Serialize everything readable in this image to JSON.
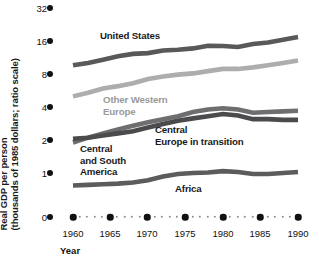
{
  "chart_data": {
    "type": "line",
    "title": "",
    "subtitle": "",
    "xlabel": "Year",
    "ylabel_line1": "Real GDP per person",
    "ylabel_line2": "(thousands of 1985 dollars; ratio scale)",
    "ylabel": "Real GDP per person (thousands of 1985 dollars; ratio scale)",
    "scale": "log2",
    "grid": false,
    "legend_position": "inline-annotations",
    "ylim": [
      1,
      32
    ],
    "ytick_labels": [
      "32",
      "16",
      "8",
      "4",
      "2",
      "1",
      "0"
    ],
    "ytick_values": [
      32,
      16,
      8,
      4,
      2,
      1,
      0
    ],
    "xlim": [
      1960,
      1990
    ],
    "xtick_labels": [
      "1960",
      "1965",
      "1970",
      "1975",
      "1980",
      "1985",
      "1990"
    ],
    "xtick_values": [
      1960,
      1965,
      1970,
      1975,
      1980,
      1985,
      1990
    ],
    "x": [
      1960,
      1962,
      1964,
      1966,
      1968,
      1970,
      1972,
      1974,
      1976,
      1978,
      1980,
      1982,
      1984,
      1986,
      1988,
      1990
    ],
    "series": [
      {
        "name": "United States",
        "color": "#59595b",
        "values": [
          9.6,
          10.1,
          10.8,
          11.6,
          12.2,
          12.4,
          13.1,
          13.3,
          13.7,
          14.5,
          14.4,
          14.1,
          15.0,
          15.5,
          16.4,
          17.4
        ]
      },
      {
        "name": "Other Western Europe",
        "color": "#adadad",
        "values": [
          5.0,
          5.4,
          5.9,
          6.2,
          6.6,
          7.2,
          7.6,
          7.9,
          8.1,
          8.5,
          8.9,
          8.9,
          9.2,
          9.6,
          10.1,
          10.6
        ]
      },
      {
        "name": "Central Europe in transition",
        "color": "#6e6e70",
        "values": [
          1.9,
          2.1,
          2.3,
          2.5,
          2.7,
          2.9,
          3.1,
          3.3,
          3.6,
          3.8,
          3.9,
          3.8,
          3.55,
          3.6,
          3.65,
          3.7
        ]
      },
      {
        "name": "Central and South America",
        "color": "#4b4b4d",
        "values": [
          2.05,
          2.1,
          2.2,
          2.3,
          2.4,
          2.6,
          2.8,
          3.0,
          3.15,
          3.3,
          3.45,
          3.35,
          3.1,
          3.1,
          3.05,
          3.05
        ]
      },
      {
        "name": "Africa",
        "color": "#5c5c5e",
        "values": [
          0.77,
          0.78,
          0.79,
          0.8,
          0.82,
          0.86,
          0.93,
          0.98,
          1.0,
          1.01,
          1.04,
          1.02,
          0.98,
          0.98,
          1.0,
          1.02
        ]
      }
    ],
    "annotations": [
      {
        "text": "United States",
        "color": "#1f1f1f"
      },
      {
        "text": "Other Western\nEurope",
        "color": "#9a9a9a"
      },
      {
        "text": "Central\nEurope in transition",
        "color": "#1f1f1f"
      },
      {
        "text": "Central\nand South\nAmerica",
        "color": "#1f1f1f"
      },
      {
        "text": "Africa",
        "color": "#1f1f1f"
      }
    ]
  }
}
